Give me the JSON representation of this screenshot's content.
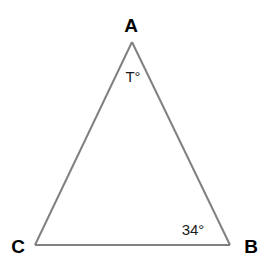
{
  "diagram": {
    "type": "triangle",
    "stroke_color": "#808080",
    "text_color": "#000000",
    "vertices": [
      {
        "name": "A",
        "label": "A",
        "position": "top"
      },
      {
        "name": "B",
        "label": "B",
        "position": "bottom-right"
      },
      {
        "name": "C",
        "label": "C",
        "position": "bottom-left"
      }
    ],
    "angles": [
      {
        "vertex": "A",
        "label": "T°",
        "value": "T"
      },
      {
        "vertex": "B",
        "label": "34°",
        "value": 34
      }
    ],
    "sides": [
      {
        "from": "A",
        "to": "B"
      },
      {
        "from": "B",
        "to": "C"
      },
      {
        "from": "C",
        "to": "A"
      }
    ]
  }
}
